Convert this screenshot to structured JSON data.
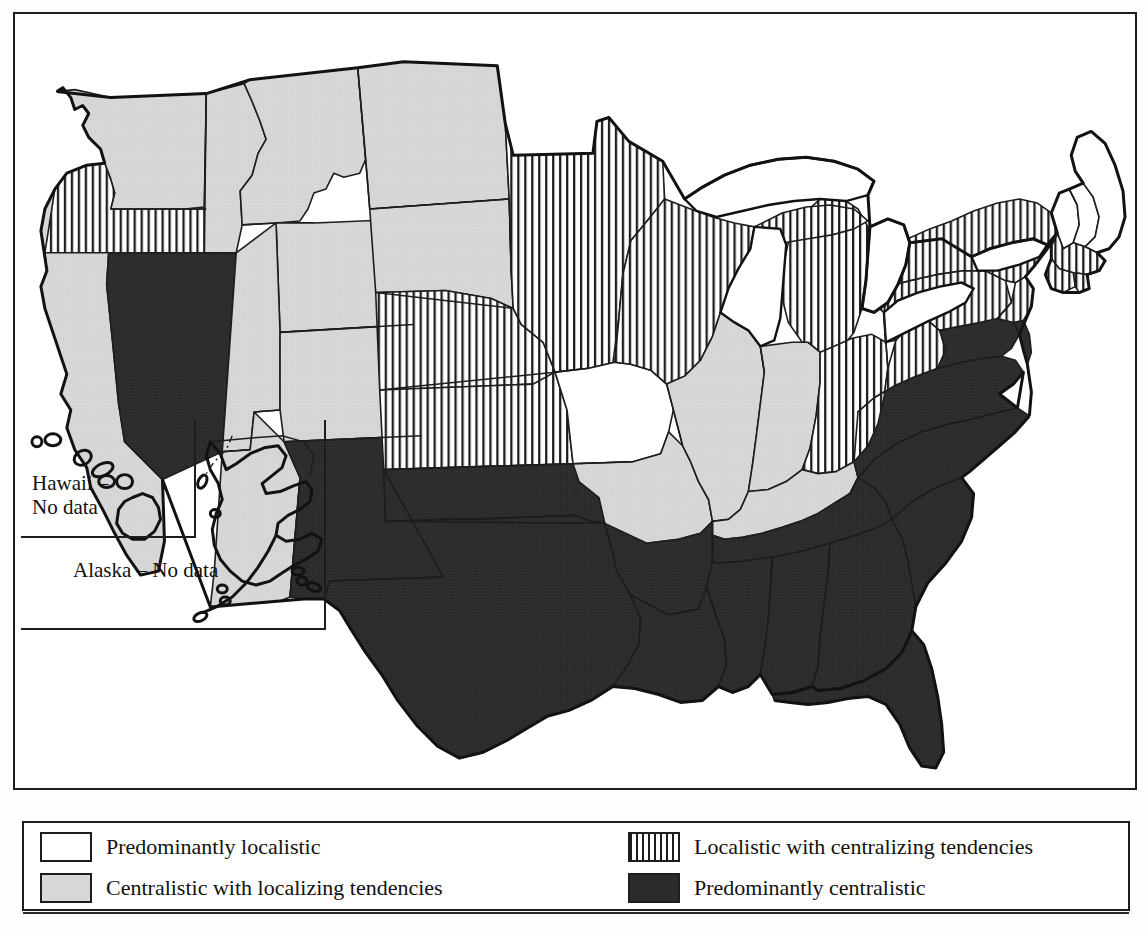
{
  "map": {
    "title": "United States political culture map",
    "frame": {
      "border_color": "#1d1d1d"
    },
    "inset": {
      "hawaii_label": "Hawaii –\nNo data",
      "alaska_label": "Alaska – No data"
    },
    "colors": {
      "predominantly_localistic": "#ffffff",
      "centralistic_with_localizing": "#d7d7d7",
      "localistic_with_centralizing": "#ffffff",
      "localistic_with_centralizing_stripe": "#1d1d1d",
      "predominantly_centralistic": "#2b2b2b",
      "outline": "#1d1d1d"
    },
    "categories": [
      {
        "key": "white",
        "label": "Predominantly localistic"
      },
      {
        "key": "gray",
        "label": "Centralistic with localizing tendencies"
      },
      {
        "key": "stripe",
        "label": "Localistic with centralizing tendencies"
      },
      {
        "key": "dark",
        "label": "Predominantly centralistic"
      }
    ],
    "states": [
      {
        "code": "WA",
        "name": "Washington",
        "category": "gray"
      },
      {
        "code": "OR",
        "name": "Oregon",
        "category": "stripe"
      },
      {
        "code": "CA",
        "name": "California",
        "category": "gray"
      },
      {
        "code": "NV",
        "name": "Nevada",
        "category": "dark"
      },
      {
        "code": "ID",
        "name": "Idaho",
        "category": "gray"
      },
      {
        "code": "MT",
        "name": "Montana",
        "category": "gray"
      },
      {
        "code": "WY",
        "name": "Wyoming",
        "category": "gray"
      },
      {
        "code": "UT",
        "name": "Utah",
        "category": "gray"
      },
      {
        "code": "AZ",
        "name": "Arizona",
        "category": "gray"
      },
      {
        "code": "CO",
        "name": "Colorado",
        "category": "gray"
      },
      {
        "code": "NM",
        "name": "New Mexico",
        "category": "dark"
      },
      {
        "code": "ND",
        "name": "North Dakota",
        "category": "gray"
      },
      {
        "code": "SD",
        "name": "South Dakota",
        "category": "gray"
      },
      {
        "code": "NE",
        "name": "Nebraska",
        "category": "stripe"
      },
      {
        "code": "KS",
        "name": "Kansas",
        "category": "stripe"
      },
      {
        "code": "OK",
        "name": "Oklahoma",
        "category": "dark"
      },
      {
        "code": "TX",
        "name": "Texas",
        "category": "dark"
      },
      {
        "code": "MN",
        "name": "Minnesota",
        "category": "stripe"
      },
      {
        "code": "IA",
        "name": "Iowa",
        "category": "white"
      },
      {
        "code": "MO",
        "name": "Missouri",
        "category": "gray"
      },
      {
        "code": "AR",
        "name": "Arkansas",
        "category": "dark"
      },
      {
        "code": "LA",
        "name": "Louisiana",
        "category": "dark"
      },
      {
        "code": "WI",
        "name": "Wisconsin",
        "category": "stripe"
      },
      {
        "code": "IL",
        "name": "Illinois",
        "category": "gray"
      },
      {
        "code": "MI",
        "name": "Michigan",
        "category": "stripe"
      },
      {
        "code": "IN",
        "name": "Indiana",
        "category": "gray"
      },
      {
        "code": "OH",
        "name": "Ohio",
        "category": "stripe"
      },
      {
        "code": "KY",
        "name": "Kentucky",
        "category": "gray"
      },
      {
        "code": "TN",
        "name": "Tennessee",
        "category": "dark"
      },
      {
        "code": "MS",
        "name": "Mississippi",
        "category": "dark"
      },
      {
        "code": "AL",
        "name": "Alabama",
        "category": "dark"
      },
      {
        "code": "GA",
        "name": "Georgia",
        "category": "dark"
      },
      {
        "code": "FL",
        "name": "Florida",
        "category": "dark"
      },
      {
        "code": "SC",
        "name": "South Carolina",
        "category": "dark"
      },
      {
        "code": "NC",
        "name": "North Carolina",
        "category": "dark"
      },
      {
        "code": "VA",
        "name": "Virginia",
        "category": "dark"
      },
      {
        "code": "WV",
        "name": "West Virginia",
        "category": "stripe"
      },
      {
        "code": "MD",
        "name": "Maryland",
        "category": "dark"
      },
      {
        "code": "DE",
        "name": "Delaware",
        "category": "dark"
      },
      {
        "code": "PA",
        "name": "Pennsylvania",
        "category": "stripe"
      },
      {
        "code": "NJ",
        "name": "New Jersey",
        "category": "stripe"
      },
      {
        "code": "NY",
        "name": "New York",
        "category": "stripe"
      },
      {
        "code": "CT",
        "name": "Connecticut",
        "category": "stripe"
      },
      {
        "code": "RI",
        "name": "Rhode Island",
        "category": "stripe"
      },
      {
        "code": "MA",
        "name": "Massachusetts",
        "category": "stripe"
      },
      {
        "code": "VT",
        "name": "Vermont",
        "category": "white"
      },
      {
        "code": "NH",
        "name": "New Hampshire",
        "category": "white"
      },
      {
        "code": "ME",
        "name": "Maine",
        "category": "white"
      },
      {
        "code": "AK",
        "name": "Alaska",
        "category": "nodata"
      },
      {
        "code": "HI",
        "name": "Hawaii",
        "category": "nodata"
      }
    ]
  }
}
